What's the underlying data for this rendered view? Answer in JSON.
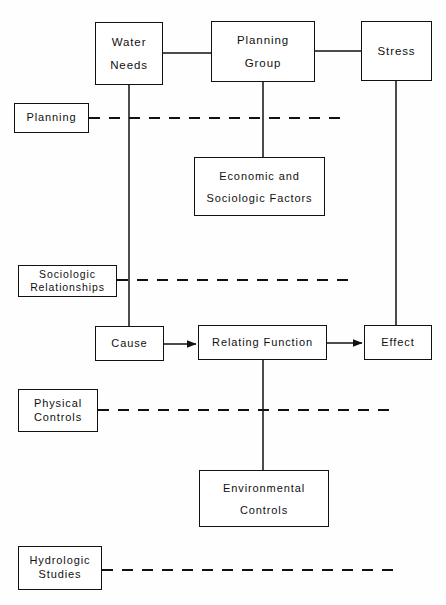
{
  "diagram": {
    "stroke_color": "#111111",
    "background_color": "#fefefe",
    "nodes": [
      {
        "id": "water-needs",
        "lines": [
          "Water",
          "Needs"
        ],
        "x": 95,
        "y": 22,
        "w": 68,
        "h": 63,
        "size": "lg",
        "spacing": "wide-gap"
      },
      {
        "id": "planning-group",
        "lines": [
          "Planning",
          "Group"
        ],
        "x": 211,
        "y": 21,
        "w": 104,
        "h": 61,
        "size": "lg",
        "spacing": "wide-gap"
      },
      {
        "id": "stress",
        "lines": [
          "Stress"
        ],
        "x": 361,
        "y": 21,
        "w": 71,
        "h": 60,
        "size": "lg",
        "spacing": "tight"
      },
      {
        "id": "planning",
        "lines": [
          "Planning"
        ],
        "x": 14,
        "y": 103,
        "w": 75,
        "h": 30,
        "size": "md",
        "spacing": "tight"
      },
      {
        "id": "economic-sociologic",
        "lines": [
          "Economic  and",
          "Sociologic  Factors"
        ],
        "x": 194,
        "y": 157,
        "w": 131,
        "h": 59,
        "size": "md",
        "spacing": "wide-gap"
      },
      {
        "id": "sociologic-rel",
        "lines": [
          "Sociologic",
          "Relationships"
        ],
        "x": 18,
        "y": 265,
        "w": 99,
        "h": 32,
        "size": "sm",
        "spacing": "tight"
      },
      {
        "id": "cause",
        "lines": [
          "Cause"
        ],
        "x": 95,
        "y": 326,
        "w": 69,
        "h": 35,
        "size": "md",
        "spacing": "tight"
      },
      {
        "id": "relating-function",
        "lines": [
          "Relating   Function"
        ],
        "x": 198,
        "y": 325,
        "w": 129,
        "h": 35,
        "size": "md",
        "spacing": "tight"
      },
      {
        "id": "effect",
        "lines": [
          "Effect"
        ],
        "x": 364,
        "y": 325,
        "w": 68,
        "h": 35,
        "size": "md",
        "spacing": "tight"
      },
      {
        "id": "physical-controls",
        "lines": [
          "Physical",
          "Controls"
        ],
        "x": 18,
        "y": 389,
        "w": 80,
        "h": 43,
        "size": "md",
        "spacing": "tight"
      },
      {
        "id": "environmental-ctl",
        "lines": [
          "Environmental",
          "Controls"
        ],
        "x": 199,
        "y": 470,
        "w": 130,
        "h": 57,
        "size": "md",
        "spacing": "wide-gap"
      },
      {
        "id": "hydrologic-studies",
        "lines": [
          "Hydrologic",
          "Studies"
        ],
        "x": 18,
        "y": 546,
        "w": 84,
        "h": 44,
        "size": "md",
        "spacing": "tight"
      }
    ],
    "solid_connectors": [
      {
        "id": "water-to-planning-group",
        "x1": 163,
        "y1": 53,
        "x2": 211,
        "y2": 53,
        "arrow": false
      },
      {
        "id": "planning-group-to-stress",
        "x1": 315,
        "y1": 51,
        "x2": 361,
        "y2": 51,
        "arrow": false
      },
      {
        "id": "water-needs-down-to-cause",
        "x1": 129,
        "y1": 85,
        "x2": 129,
        "y2": 326,
        "arrow": false
      },
      {
        "id": "planning-group-down-to-economic",
        "x1": 263,
        "y1": 82,
        "x2": 263,
        "y2": 157,
        "arrow": false
      },
      {
        "id": "stress-down-to-effect",
        "x1": 396,
        "y1": 81,
        "x2": 396,
        "y2": 325,
        "arrow": false
      },
      {
        "id": "cause-to-relating",
        "x1": 164,
        "y1": 344,
        "x2": 196,
        "y2": 344,
        "arrow": true
      },
      {
        "id": "relating-to-effect",
        "x1": 327,
        "y1": 343,
        "x2": 362,
        "y2": 343,
        "arrow": true
      },
      {
        "id": "relating-down-to-environmental",
        "x1": 263,
        "y1": 360,
        "x2": 263,
        "y2": 470,
        "arrow": false
      }
    ],
    "dashed_connectors": [
      {
        "id": "planning-dashed",
        "x1": 89,
        "y1": 118,
        "x2": 345,
        "y2": 118
      },
      {
        "id": "sociologic-dashed",
        "x1": 117,
        "y1": 280,
        "x2": 356,
        "y2": 280
      },
      {
        "id": "physical-controls-dashed",
        "x1": 98,
        "y1": 410,
        "x2": 396,
        "y2": 410
      },
      {
        "id": "hydrologic-studies-dashed",
        "x1": 102,
        "y1": 570,
        "x2": 400,
        "y2": 570
      }
    ]
  }
}
